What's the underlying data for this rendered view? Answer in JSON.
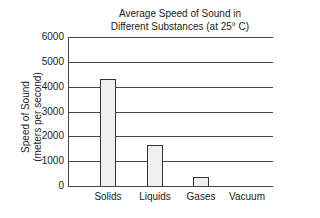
{
  "chart_data": {
    "type": "bar",
    "title": "Average Speed of Sound in Different Substances (at 25° C)",
    "title_lines": [
      "Average Speed of Sound in",
      "Different Substances (at 25° C)"
    ],
    "xlabel": "",
    "ylabel": "Speed of Sound (meters per second)",
    "ylabel_lines": [
      "Speed of Sound",
      "(meters per second)"
    ],
    "categories": [
      "Solids",
      "Liquids",
      "Gases",
      "Vacuum"
    ],
    "values": [
      4300,
      1650,
      350,
      0
    ],
    "ylim": [
      0,
      6000
    ],
    "yticks": [
      "0",
      "1000",
      "2000",
      "3000",
      "4000",
      "5000",
      "6000"
    ],
    "grid": true,
    "legend": null
  }
}
